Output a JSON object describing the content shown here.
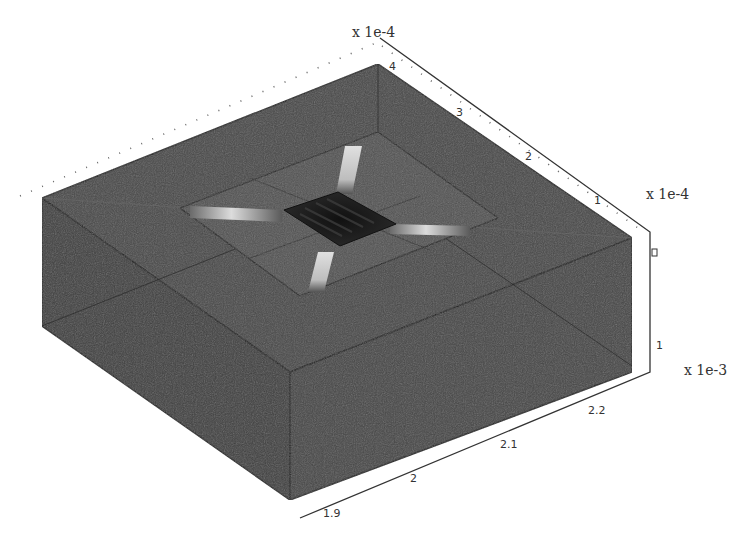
{
  "figure": {
    "title": "",
    "colors": {
      "block_face_top": "#4a4a4a",
      "block_face_left": "#3f3f3f",
      "block_face_front": "#444444",
      "cavity_floor": "#505050",
      "membrane": "#1c1c1c",
      "beam_highlight": "#d8d8d8",
      "edge_line": "#222222",
      "background": "#ffffff"
    }
  },
  "axes": {
    "y_axis": {
      "multiplier_label": "x 1e-4",
      "ticks": [
        "4",
        "3",
        "2",
        "1"
      ]
    },
    "z_axis": {
      "multiplier_label": "x 1e-4",
      "ticks": [
        "0",
        "1"
      ]
    },
    "x_axis": {
      "multiplier_label": "x 1e-3",
      "ticks": [
        "1.9",
        "2",
        "2.1",
        "2.2"
      ]
    }
  }
}
